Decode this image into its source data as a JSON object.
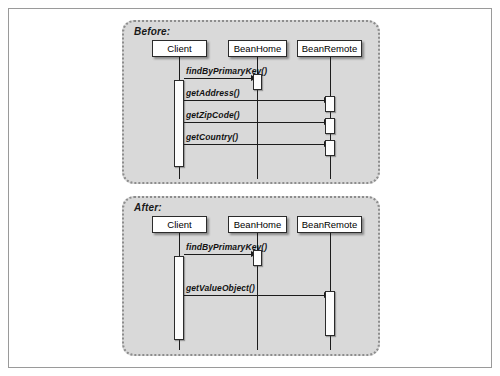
{
  "figure": {
    "kind": "uml-sequence-diagram",
    "background_color": "#ffffff",
    "frame_border_color": "#9a9a9a",
    "panel_background_color": "#d9d9d9",
    "panel_border_color": "#8d8d8d",
    "line_color": "#1c1c1c",
    "box_fill_color": "#ffffff"
  },
  "panels": [
    {
      "id": "before",
      "label": "Before:",
      "participants": [
        {
          "id": "client",
          "name": "Client"
        },
        {
          "id": "beanhome",
          "name": "BeanHome"
        },
        {
          "id": "beanremote",
          "name": "BeanRemote"
        }
      ],
      "messages": [
        {
          "label": "findByPrimaryKey()",
          "from": "client",
          "to": "beanhome"
        },
        {
          "label": "getAddress()",
          "from": "client",
          "to": "beanremote"
        },
        {
          "label": "getZipCode()",
          "from": "client",
          "to": "beanremote"
        },
        {
          "label": "getCountry()",
          "from": "client",
          "to": "beanremote"
        }
      ]
    },
    {
      "id": "after",
      "label": "After:",
      "participants": [
        {
          "id": "client",
          "name": "Client"
        },
        {
          "id": "beanhome",
          "name": "BeanHome"
        },
        {
          "id": "beanremote",
          "name": "BeanRemote"
        }
      ],
      "messages": [
        {
          "label": "findByPrimaryKey()",
          "from": "client",
          "to": "beanhome"
        },
        {
          "label": "getValueObject()",
          "from": "client",
          "to": "beanremote"
        }
      ]
    }
  ]
}
